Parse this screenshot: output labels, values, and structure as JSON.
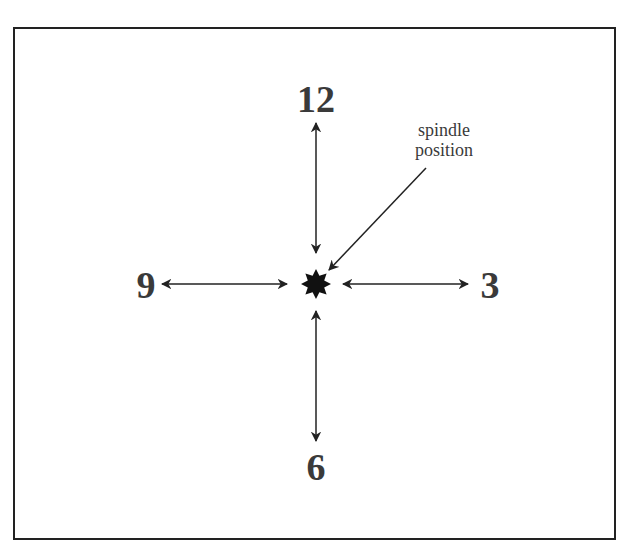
{
  "diagram": {
    "positions": {
      "top": "12",
      "right": "3",
      "bottom": "6",
      "left": "9"
    },
    "annotation": {
      "line1": "spindle",
      "line2": "position"
    },
    "center_marker": "8-point-star",
    "colors": {
      "text": "#3a3a3a",
      "arrows": "#222222",
      "frame": "#222222",
      "background": "#ffffff"
    }
  }
}
